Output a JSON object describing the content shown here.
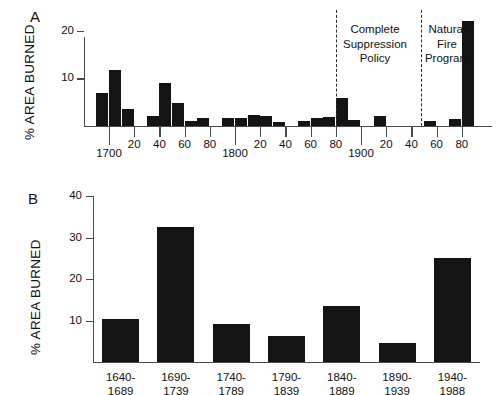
{
  "figure": {
    "panels": [
      {
        "letter": "A",
        "ylabel": "% AREA BURNED",
        "y_ticks": [
          "10",
          "20"
        ],
        "x_ticks": [
          "1700",
          "20",
          "40",
          "60",
          "80",
          "1800",
          "20",
          "40",
          "60",
          "80",
          "1900",
          "20",
          "40",
          "60",
          "80"
        ],
        "annotations": [
          {
            "lines": [
              "Complete",
              "Suppression",
              "Policy"
            ]
          },
          {
            "lines": [
              "Natural",
              "Fire",
              "Program"
            ]
          }
        ]
      },
      {
        "letter": "B",
        "ylabel": "% AREA BURNED",
        "y_ticks": [
          "10",
          "20",
          "30",
          "40"
        ],
        "x_ticks": [
          "1640-\n1689",
          "1690-\n1739",
          "1740-\n1789",
          "1790-\n1839",
          "1840-\n1889",
          "1890-\n1939",
          "1940-\n1988"
        ]
      }
    ],
    "colors": {
      "bar": "#141414",
      "axis": "#4a4a4a",
      "text": "#111111",
      "background": "#ffffff",
      "divider": "#2b2b2b"
    }
  },
  "chart_data": [
    {
      "type": "bar",
      "panel": "A",
      "title": "",
      "xlabel": "",
      "ylabel": "% AREA BURNED",
      "ylim": [
        0,
        24
      ],
      "yticks": [
        10,
        20
      ],
      "xlim": [
        1690,
        1990
      ],
      "xticks": [
        1700,
        1720,
        1740,
        1760,
        1780,
        1800,
        1820,
        1840,
        1860,
        1880,
        1900,
        1920,
        1940,
        1960,
        1980
      ],
      "xticklabels": [
        "1700",
        "20",
        "40",
        "60",
        "80",
        "1800",
        "20",
        "40",
        "60",
        "80",
        "1900",
        "20",
        "40",
        "60",
        "80"
      ],
      "grid": false,
      "legend": "none",
      "bar_width_years": 10,
      "categories": [
        "1690s",
        "1700s",
        "1710s",
        "1720s",
        "1730s",
        "1740s",
        "1750s",
        "1760s",
        "1770s",
        "1780s",
        "1790s",
        "1800s",
        "1810s",
        "1820s",
        "1830s",
        "1840s",
        "1850s",
        "1860s",
        "1870s",
        "1880s",
        "1890s",
        "1900s",
        "1910s",
        "1920s",
        "1930s",
        "1940s",
        "1950s",
        "1960s",
        "1970s",
        "1980s"
      ],
      "values": [
        7.0,
        11.8,
        3.6,
        0,
        2.1,
        9.0,
        4.8,
        1.1,
        1.7,
        0,
        1.7,
        1.6,
        2.4,
        2.2,
        0.8,
        0,
        1.0,
        1.7,
        1.8,
        5.9,
        1.3,
        0,
        2.2,
        0,
        0,
        0,
        1.0,
        0,
        1.5,
        22.1
      ],
      "annotations": [
        {
          "text": "Complete Suppression Policy",
          "x_year": 1880,
          "note": "dashed divider at 1880"
        },
        {
          "text": "Natural Fire Program",
          "x_year": 1948,
          "note": "dashed divider at 1948"
        }
      ]
    },
    {
      "type": "bar",
      "panel": "B",
      "title": "",
      "xlabel": "",
      "ylabel": "% AREA BURNED",
      "ylim": [
        0,
        40
      ],
      "yticks": [
        10,
        20,
        30,
        40
      ],
      "grid": false,
      "legend": "none",
      "categories": [
        "1640-1689",
        "1690-1739",
        "1740-1789",
        "1790-1839",
        "1840-1889",
        "1890-1939",
        "1940-1988"
      ],
      "values": [
        10.3,
        32.5,
        9.1,
        6.3,
        13.5,
        4.5,
        25.0
      ]
    }
  ]
}
